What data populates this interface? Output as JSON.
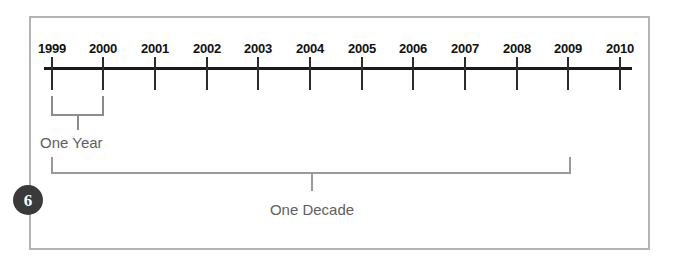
{
  "figure": {
    "badge_number": "6",
    "frame_color": "#b3b3b3",
    "axis_color": "#1a1a1a",
    "bracket_color": "#8c8c8c",
    "label_color": "#5e5e5e"
  },
  "chart_data": {
    "type": "timeline",
    "title": "",
    "xlabel": "",
    "ylabel": "",
    "axis_range": [
      1999,
      2010
    ],
    "tick_labels": [
      "1999",
      "2000",
      "2001",
      "2002",
      "2003",
      "2004",
      "2005",
      "2006",
      "2007",
      "2008",
      "2009",
      "2010"
    ],
    "tick_values": [
      1999,
      2000,
      2001,
      2002,
      2003,
      2004,
      2005,
      2006,
      2007,
      2008,
      2009,
      2010
    ],
    "grid": false,
    "legend": "none",
    "annotations": [
      {
        "label": "One Year",
        "span_start": 1999,
        "span_end": 2000,
        "span_length": 1,
        "unit": "year"
      },
      {
        "label": "One Decade",
        "span_start": 1999,
        "span_end": 2009,
        "span_length": 10,
        "unit": "year"
      }
    ]
  },
  "ticks": [
    {
      "label": "1999",
      "x": 52
    },
    {
      "label": "2000",
      "x": 103
    },
    {
      "label": "2001",
      "x": 155
    },
    {
      "label": "2002",
      "x": 207
    },
    {
      "label": "2003",
      "x": 258
    },
    {
      "label": "2004",
      "x": 310
    },
    {
      "label": "2005",
      "x": 362
    },
    {
      "label": "2006",
      "x": 413
    },
    {
      "label": "2007",
      "x": 465
    },
    {
      "label": "2008",
      "x": 517
    },
    {
      "label": "2009",
      "x": 568
    },
    {
      "label": "2010",
      "x": 620
    }
  ],
  "annotations": {
    "one_year_label": "One Year",
    "one_decade_label": "One Decade"
  }
}
